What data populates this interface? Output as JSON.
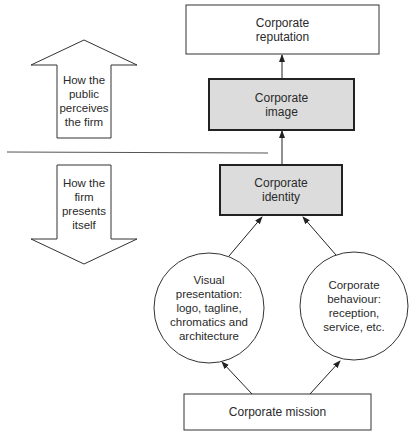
{
  "diagram": {
    "nodes": {
      "reputation": {
        "label": "Corporate\nreputation",
        "style": "plain"
      },
      "image": {
        "label": "Corporate\nimage",
        "style": "shaded"
      },
      "identity": {
        "label": "Corporate\nidentity",
        "style": "shaded"
      },
      "visual": {
        "label": "Visual\npresentation:\nlogo, tagline,\nchromatics and\narchitecture",
        "shape": "circle"
      },
      "behaviour": {
        "label": "Corporate\nbehaviour:\nreception,\nservice, etc.",
        "shape": "circle"
      },
      "mission": {
        "label": "Corporate mission",
        "style": "plain"
      }
    },
    "side_arrows": {
      "up": {
        "label": "How the\npublic\nperceives\nthe firm",
        "direction": "up"
      },
      "down": {
        "label": "How the\nfirm\npresents\nitself",
        "direction": "down"
      }
    },
    "edges": [
      {
        "from": "image",
        "to": "reputation"
      },
      {
        "from": "identity",
        "to": "image"
      },
      {
        "from": "visual",
        "to": "identity"
      },
      {
        "from": "behaviour",
        "to": "identity"
      },
      {
        "from": "mission",
        "to": "visual"
      },
      {
        "from": "mission",
        "to": "behaviour"
      }
    ],
    "colors": {
      "shaded_fill": "#dcdcdc",
      "stroke": "#222222",
      "divider": "#555555"
    }
  }
}
